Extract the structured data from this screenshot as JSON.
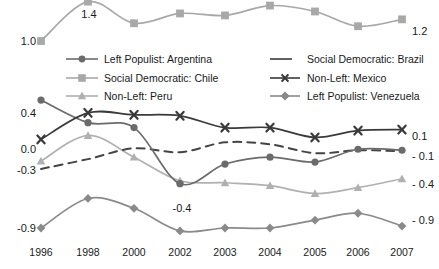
{
  "chart_data": {
    "type": "line",
    "title": "",
    "subtitle": "",
    "xlabel": "",
    "ylabel": "",
    "grid": false,
    "legend_position": "inside-top-center",
    "categories": [
      "1996",
      "1998",
      "2000",
      "2002",
      "2003",
      "2004",
      "2005",
      "2006",
      "2007"
    ],
    "ylim": [
      -1.0,
      1.5
    ],
    "series": [
      {
        "name": "Left Populist: Argentina",
        "marker": "circle",
        "dash": false,
        "color": "#6b6b6b",
        "values": [
          0.4,
          0.17,
          0.12,
          -0.45,
          -0.25,
          -0.18,
          -0.23,
          -0.1,
          -0.11
        ]
      },
      {
        "name": "Social Democratic: Brazil",
        "marker": "none",
        "dash": true,
        "color": "#444444",
        "values": [
          -0.3,
          -0.2,
          -0.09,
          -0.13,
          -0.03,
          -0.05,
          -0.14,
          -0.11,
          -0.12
        ]
      },
      {
        "name": "Social Democratic: Chile",
        "marker": "square",
        "dash": false,
        "color": "#a8a8a8",
        "values": [
          1.0,
          1.4,
          1.18,
          1.28,
          1.26,
          1.36,
          1.3,
          1.15,
          1.22
        ]
      },
      {
        "name": "Non-Left: Mexico",
        "marker": "x",
        "dash": false,
        "color": "#3a3a3a",
        "values": [
          0.0,
          0.27,
          0.25,
          0.24,
          0.12,
          0.12,
          0.02,
          0.09,
          0.1
        ]
      },
      {
        "name": "Non-Left: Peru",
        "marker": "triangle",
        "dash": false,
        "color": "#b0b0b0",
        "values": [
          -0.22,
          0.04,
          -0.18,
          -0.42,
          -0.44,
          -0.47,
          -0.55,
          -0.49,
          -0.4
        ]
      },
      {
        "name": "Left Populist: Venezuela",
        "marker": "diamond",
        "dash": false,
        "color": "#8a8a8a",
        "values": [
          -0.9,
          -0.6,
          -0.7,
          -0.93,
          -0.9,
          -0.9,
          -0.82,
          -0.75,
          -0.88
        ]
      }
    ],
    "edge_labels_left": [
      "1.0",
      "0.4",
      "0.0",
      "-0.3",
      "-0.9"
    ],
    "edge_labels_right": [
      "1.2",
      "0.1",
      "- 0.1",
      "- 0.4",
      "- 0.9"
    ],
    "annotations": [
      {
        "text": "1.4",
        "note": "peak of Social Democratic: Chile at 1998"
      },
      {
        "text": "-0.4",
        "note": "trough near Left Populist: Argentina at 2002"
      }
    ]
  },
  "legend": {
    "items": [
      {
        "label": "Left Populist: Argentina"
      },
      {
        "label": "Social Democratic: Brazil"
      },
      {
        "label": "Social Democratic: Chile"
      },
      {
        "label": "Non-Left: Mexico"
      },
      {
        "label": "Non-Left: Peru"
      },
      {
        "label": "Left Populist: Venezuela"
      }
    ]
  },
  "edge": {
    "l0": "1.0",
    "l1": "0.4",
    "l2": "0.0",
    "l3": "-0.3",
    "l4": "-0.9",
    "r0": "1.2",
    "r1": "0.1",
    "r2": "- 0.1",
    "r3": "- 0.4",
    "r4": "- 0.9",
    "a_top": "1.4",
    "a_mid": "-0.4"
  },
  "xaxis": {
    "t0": "1996",
    "t1": "1998",
    "t2": "2000",
    "t3": "2002",
    "t4": "2003",
    "t5": "2004",
    "t6": "2005",
    "t7": "2006",
    "t8": "2007"
  }
}
